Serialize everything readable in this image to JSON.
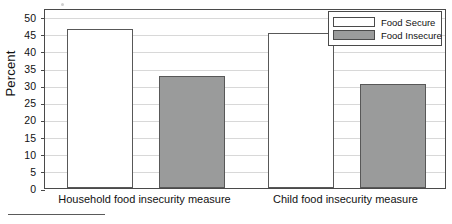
{
  "chart_data": {
    "type": "bar",
    "title": "",
    "subtitle": "",
    "xlabel": "",
    "ylabel": "Percent",
    "ylim": [
      0,
      52.5
    ],
    "yticks": [
      0,
      5,
      10,
      15,
      20,
      25,
      30,
      35,
      40,
      45,
      50
    ],
    "ytick_labels": [
      "0",
      "5",
      "10",
      "15",
      "20",
      "25",
      "30",
      "35",
      "40",
      "45",
      "50"
    ],
    "grid": true,
    "legend_position": "top-right",
    "categories": [
      "Household food insecurity measure",
      "Child food insecurity measure"
    ],
    "series": [
      {
        "name": "Food Secure",
        "color": "#ffffff",
        "edge_color": "#585858",
        "values": [
          46.5,
          45.3
        ]
      },
      {
        "name": "Food Insecure",
        "color": "#9a9b9b",
        "edge_color": "#585858",
        "values": [
          32.8,
          30.4
        ]
      }
    ],
    "annotations": []
  },
  "axes": {
    "y_title": "Percent"
  },
  "legend": {
    "entries": [
      {
        "label": "Food Secure"
      },
      {
        "label": "Food Insecure"
      }
    ]
  },
  "colors": {
    "food_secure": "#ffffff",
    "food_insecure": "#9a9b9b",
    "frame": "#4a4a4a",
    "gridline": "#d8d8d8",
    "text": "#111111"
  }
}
